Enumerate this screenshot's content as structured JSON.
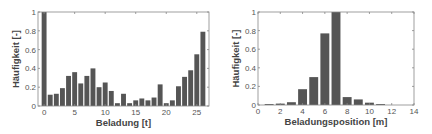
{
  "chart_data": [
    {
      "type": "bar",
      "title": "",
      "xlabel": "Beladung [t]",
      "ylabel": "Häufigkeit [-]",
      "x": [
        0,
        1,
        2,
        3,
        4,
        5,
        6,
        7,
        8,
        9,
        10,
        11,
        12,
        13,
        14,
        15,
        16,
        17,
        18,
        19,
        20,
        21,
        22,
        23,
        24,
        25,
        26
      ],
      "values": [
        1.0,
        0.12,
        0.13,
        0.19,
        0.32,
        0.36,
        0.24,
        0.32,
        0.4,
        0.2,
        0.25,
        0.16,
        0.03,
        0.13,
        0.03,
        0.06,
        0.08,
        0.06,
        0.09,
        0.23,
        0.03,
        0.06,
        0.21,
        0.31,
        0.38,
        0.55,
        0.79
      ],
      "xlim": [
        -1,
        27
      ],
      "ylim": [
        0,
        1
      ],
      "xticks": [
        0,
        5,
        10,
        15,
        20,
        25
      ],
      "yticks": [
        0,
        0.2,
        0.4,
        0.6,
        0.8,
        1
      ],
      "ytick_labels": [
        "0",
        "0.2",
        "0.4",
        "0.6",
        "0.8",
        "1"
      ],
      "bar_color": "#555555",
      "grid": false
    },
    {
      "type": "bar",
      "title": "",
      "xlabel": "Beladungsposition [m]",
      "ylabel": "Häufigkeit [-]",
      "x": [
        1,
        2,
        3,
        4,
        5,
        6,
        7,
        8,
        9,
        10,
        11
      ],
      "values": [
        0.01,
        0.015,
        0.03,
        0.17,
        0.3,
        0.77,
        1.0,
        0.085,
        0.06,
        0.025,
        0.01
      ],
      "xlim": [
        0,
        14
      ],
      "ylim": [
        0,
        1
      ],
      "xticks": [
        0,
        2,
        4,
        6,
        8,
        10,
        12,
        14
      ],
      "yticks": [
        0,
        0.2,
        0.4,
        0.6,
        0.8,
        1
      ],
      "ytick_labels": [
        "0",
        "0.2",
        "0.4",
        "0.6",
        "0.8",
        "1"
      ],
      "bar_color": "#555555",
      "grid": false
    }
  ]
}
